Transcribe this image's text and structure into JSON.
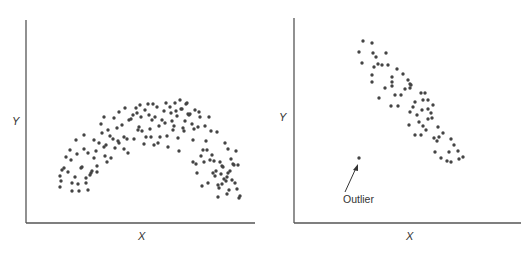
{
  "chart_data": [
    {
      "type": "scatter",
      "title": "",
      "xlabel": "X",
      "ylabel": "Y",
      "grid": false,
      "legend": null,
      "description": "Curvilinear (inverted-U / arch) relationship",
      "coordinate_space": "pixel (panel-local, origin top-left); no numeric ticks shown",
      "axes": {
        "origin": [
          26,
          223
        ],
        "x_end": 255,
        "y_top": 20
      },
      "points": [
        [
          60,
          176
        ],
        [
          61,
          181
        ],
        [
          60,
          187
        ],
        [
          62,
          170
        ],
        [
          64,
          168
        ],
        [
          66,
          157
        ],
        [
          68,
          172
        ],
        [
          70,
          150
        ],
        [
          71,
          160
        ],
        [
          72,
          183
        ],
        [
          72,
          191
        ],
        [
          75,
          177
        ],
        [
          76,
          140
        ],
        [
          77,
          154
        ],
        [
          78,
          184
        ],
        [
          79,
          191
        ],
        [
          81,
          168
        ],
        [
          82,
          167
        ],
        [
          84,
          149
        ],
        [
          84,
          135
        ],
        [
          86,
          178
        ],
        [
          86,
          183
        ],
        [
          88,
          190
        ],
        [
          88,
          153
        ],
        [
          90,
          175
        ],
        [
          91,
          173
        ],
        [
          92,
          171
        ],
        [
          94,
          158
        ],
        [
          94,
          140
        ],
        [
          96,
          151
        ],
        [
          97,
          172
        ],
        [
          97,
          166
        ],
        [
          99,
          143
        ],
        [
          101,
          124
        ],
        [
          102,
          133
        ],
        [
          104,
          117
        ],
        [
          104,
          147
        ],
        [
          105,
          156
        ],
        [
          106,
          145
        ],
        [
          108,
          130
        ],
        [
          107,
          162
        ],
        [
          110,
          136
        ],
        [
          111,
          158
        ],
        [
          113,
          139
        ],
        [
          114,
          118
        ],
        [
          115,
          148
        ],
        [
          117,
          128
        ],
        [
          118,
          141
        ],
        [
          119,
          143
        ],
        [
          119,
          112
        ],
        [
          122,
          125
        ],
        [
          124,
          137
        ],
        [
          124,
          149
        ],
        [
          125,
          108
        ],
        [
          127,
          139
        ],
        [
          128,
          153
        ],
        [
          129,
          120
        ],
        [
          131,
          119
        ],
        [
          133,
          115
        ],
        [
          134,
          139
        ],
        [
          136,
          108
        ],
        [
          137,
          113
        ],
        [
          138,
          130
        ],
        [
          139,
          127
        ],
        [
          140,
          105
        ],
        [
          141,
          117
        ],
        [
          142,
          131
        ],
        [
          144,
          144
        ],
        [
          145,
          110
        ],
        [
          146,
          137
        ],
        [
          148,
          104
        ],
        [
          149,
          115
        ],
        [
          150,
          129
        ],
        [
          151,
          137
        ],
        [
          152,
          120
        ],
        [
          153,
          104
        ],
        [
          154,
          145
        ],
        [
          155,
          117
        ],
        [
          157,
          107
        ],
        [
          158,
          143
        ],
        [
          159,
          126
        ],
        [
          160,
          137
        ],
        [
          162,
          120
        ],
        [
          164,
          111
        ],
        [
          165,
          123
        ],
        [
          166,
          103
        ],
        [
          167,
          136
        ],
        [
          168,
          147
        ],
        [
          170,
          107
        ],
        [
          171,
          113
        ],
        [
          172,
          121
        ],
        [
          173,
          130
        ],
        [
          174,
          126
        ],
        [
          175,
          103
        ],
        [
          176,
          111
        ],
        [
          177,
          116
        ],
        [
          178,
          138
        ],
        [
          179,
          151
        ],
        [
          180,
          100
        ],
        [
          181,
          109
        ],
        [
          182,
          109
        ],
        [
          183,
          128
        ],
        [
          184,
          131
        ],
        [
          185,
          121
        ],
        [
          186,
          104
        ],
        [
          187,
          103
        ],
        [
          188,
          114
        ],
        [
          189,
          115
        ],
        [
          190,
          114
        ],
        [
          192,
          124
        ],
        [
          193,
          140
        ],
        [
          193,
          162
        ],
        [
          194,
          129
        ],
        [
          195,
          110
        ],
        [
          196,
          164
        ],
        [
          197,
          173
        ],
        [
          198,
          127
        ],
        [
          199,
          112
        ],
        [
          200,
          117
        ],
        [
          201,
          156
        ],
        [
          202,
          186
        ],
        [
          203,
          150
        ],
        [
          204,
          162
        ],
        [
          205,
          126
        ],
        [
          206,
          141
        ],
        [
          207,
          150
        ],
        [
          208,
          183
        ],
        [
          209,
          117
        ],
        [
          210,
          160
        ],
        [
          211,
          131
        ],
        [
          212,
          155
        ],
        [
          213,
          173
        ],
        [
          214,
          161
        ],
        [
          215,
          176
        ],
        [
          216,
          171
        ],
        [
          217,
          132
        ],
        [
          218,
          185
        ],
        [
          219,
          188
        ],
        [
          220,
          162
        ],
        [
          221,
          174
        ],
        [
          222,
          166
        ],
        [
          223,
          167
        ],
        [
          224,
          179
        ],
        [
          225,
          143
        ],
        [
          226,
          181
        ],
        [
          227,
          177
        ],
        [
          228,
          149
        ],
        [
          229,
          190
        ],
        [
          230,
          171
        ],
        [
          231,
          159
        ],
        [
          232,
          180
        ],
        [
          233,
          164
        ],
        [
          234,
          165
        ],
        [
          235,
          183
        ],
        [
          236,
          151
        ],
        [
          237,
          189
        ],
        [
          238,
          165
        ],
        [
          239,
          198
        ],
        [
          240,
          196
        ],
        [
          218,
          197
        ],
        [
          227,
          194
        ],
        [
          222,
          184
        ],
        [
          228,
          173
        ]
      ]
    },
    {
      "type": "scatter",
      "title": "",
      "xlabel": "X",
      "ylabel": "Y",
      "grid": false,
      "legend": null,
      "description": "Negative linear relationship with one outlier",
      "coordinate_space": "pixel (panel-local, origin top-left); no numeric ticks shown",
      "axes": {
        "origin": [
          29,
          223
        ],
        "x_end": 256,
        "y_top": 20
      },
      "points": [
        [
          98,
          41
        ],
        [
          107,
          43
        ],
        [
          94,
          52
        ],
        [
          108,
          53
        ],
        [
          121,
          53
        ],
        [
          111,
          57
        ],
        [
          97,
          63
        ],
        [
          113,
          64
        ],
        [
          109,
          67
        ],
        [
          117,
          65
        ],
        [
          123,
          65
        ],
        [
          132,
          69
        ],
        [
          127,
          77
        ],
        [
          107,
          75
        ],
        [
          138,
          74
        ],
        [
          143,
          80
        ],
        [
          107,
          82
        ],
        [
          127,
          82
        ],
        [
          145,
          84
        ],
        [
          127,
          86
        ],
        [
          146,
          85
        ],
        [
          145,
          88
        ],
        [
          120,
          88
        ],
        [
          140,
          89
        ],
        [
          114,
          98
        ],
        [
          130,
          95
        ],
        [
          136,
          95
        ],
        [
          156,
          93
        ],
        [
          160,
          93
        ],
        [
          163,
          100
        ],
        [
          150,
          102
        ],
        [
          158,
          100
        ],
        [
          126,
          106
        ],
        [
          133,
          106
        ],
        [
          148,
          107
        ],
        [
          168,
          105
        ],
        [
          157,
          110
        ],
        [
          163,
          109
        ],
        [
          145,
          112
        ],
        [
          166,
          113
        ],
        [
          152,
          115
        ],
        [
          163,
          119
        ],
        [
          167,
          118
        ],
        [
          144,
          125
        ],
        [
          154,
          122
        ],
        [
          158,
          126
        ],
        [
          173,
          127
        ],
        [
          161,
          130
        ],
        [
          156,
          135
        ],
        [
          150,
          135
        ],
        [
          178,
          133
        ],
        [
          186,
          139
        ],
        [
          169,
          138
        ],
        [
          174,
          137
        ],
        [
          172,
          141
        ],
        [
          189,
          145
        ],
        [
          170,
          152
        ],
        [
          184,
          152
        ],
        [
          193,
          151
        ],
        [
          176,
          158
        ],
        [
          182,
          161
        ],
        [
          194,
          159
        ],
        [
          198,
          157
        ],
        [
          186,
          162
        ]
      ],
      "outlier": [
        94,
        158
      ],
      "annotations": [
        {
          "text": "Outlier",
          "x": 78,
          "y": 201,
          "arrow_from": [
            80,
            192
          ],
          "arrow_to": [
            93,
            165
          ]
        }
      ]
    }
  ],
  "left_chart": {
    "x_label": "X",
    "y_label": "Y"
  },
  "right_chart": {
    "x_label": "X",
    "y_label": "Y",
    "outlier_label": "Outlier"
  }
}
